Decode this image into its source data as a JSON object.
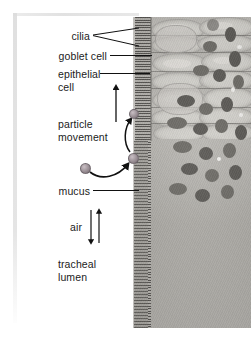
{
  "figure": {
    "type": "labeled-micrograph",
    "background_color": "#ffffff",
    "plate_color": "#a9a7a2"
  },
  "labels": {
    "cilia": "cilia",
    "goblet_cell": "goblet cell",
    "epithelial_cell_line1": "epithelial",
    "epithelial_cell_line2": "cell",
    "particle_movement_line1": "particle",
    "particle_movement_line2": "movement",
    "mucus": "mucus",
    "air": "air",
    "tracheal_lumen_line1": "tracheal",
    "tracheal_lumen_line2": "lumen"
  },
  "annotations": {
    "leader_line_color": "#111111",
    "arrow_color": "#111111",
    "particle_color": "#9b9096",
    "upward_arrow_name": "mucus-escalator-arrow",
    "air_arrow_up": "air-arrow-up",
    "air_arrow_down": "air-arrow-down",
    "particle_path": "curved-arrow-particle-to-mucus"
  }
}
